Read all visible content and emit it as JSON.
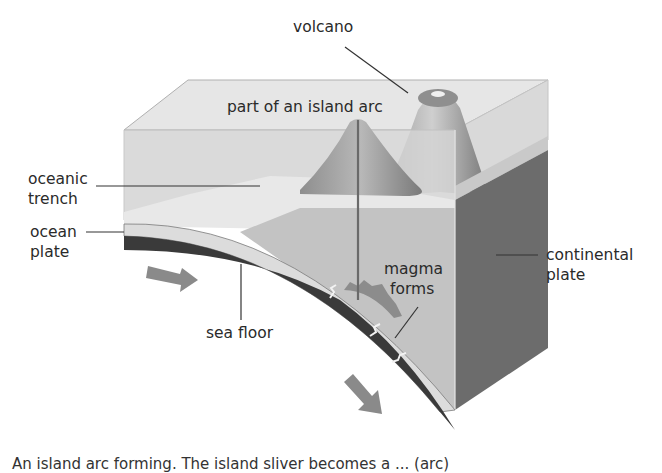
{
  "diagram": {
    "type": "cross-section",
    "labels": {
      "volcano": "volcano",
      "island_arc": "part of an island arc",
      "oceanic_trench": [
        "oceanic",
        "trench"
      ],
      "ocean_plate": [
        "ocean",
        "plate"
      ],
      "continental_plate": [
        "continental",
        "plate"
      ],
      "magma_forms": [
        "magma",
        "forms"
      ],
      "sea_floor": "sea floor"
    },
    "caption": "An island arc forming. The island sliver becomes a ... (arc)",
    "colors": {
      "water": "#dedede",
      "water_edge": "#c8c8c8",
      "island_arc": "#9a9a9a",
      "continental_front": "#bdbdbd",
      "continental_side": "#6e6e6e",
      "ocean_plate_dark": "#3c3c3c",
      "sea_floor_light": "#d6d6d6",
      "arrow": "#8a8a8a",
      "magma": "#8c8c8c"
    },
    "arrows": [
      {
        "name": "ocean-plate-motion-arrow",
        "direction": "right"
      },
      {
        "name": "subduction-arrow",
        "direction": "down-right"
      }
    ]
  }
}
